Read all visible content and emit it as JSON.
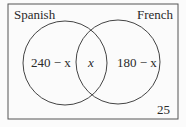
{
  "diagram": {
    "type": "venn",
    "sets": [
      {
        "name": "Spanish",
        "region_label": "240 − x"
      },
      {
        "name": "French",
        "region_label": "180 − x"
      }
    ],
    "intersection_label": "x",
    "outside_label": "25",
    "colors": {
      "line": "#444444",
      "text": "#2a2a2a",
      "background": "#fbfbfb"
    }
  }
}
